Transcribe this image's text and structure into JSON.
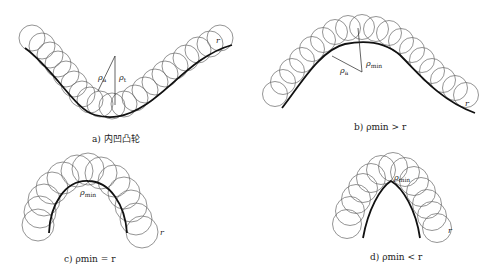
{
  "panels": [
    {
      "id": "a",
      "caption": "a) 内凹凸轮",
      "labels": {
        "rho_a": "ρ",
        "rho_a_sub": "a",
        "rho_t": "ρ",
        "rho_t_sub": "t",
        "r": "r"
      }
    },
    {
      "id": "b",
      "caption": "b) ρmin > r",
      "labels": {
        "rho_min": "ρ",
        "rho_min_sub": "min",
        "rho_a": "ρ",
        "rho_a_sub": "a",
        "r": "r"
      }
    },
    {
      "id": "c",
      "caption": "c) ρmin = r",
      "labels": {
        "rho_min": "ρ",
        "rho_min_sub": "min",
        "r": "r"
      }
    },
    {
      "id": "d",
      "caption": "d) ρmin < r",
      "labels": {
        "rho_min": "ρ",
        "rho_min_sub": "min",
        "r": "r"
      }
    }
  ],
  "colors": {
    "profile": "#111111",
    "roller": "#666666",
    "background": "#ffffff"
  }
}
